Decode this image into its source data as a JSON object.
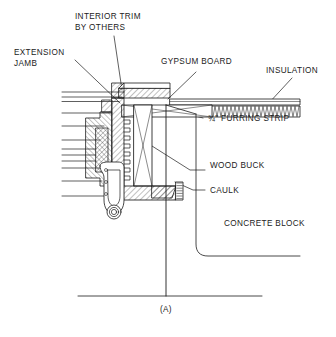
{
  "figure": {
    "id": "window-jamb-detail-a",
    "caption": "(A)",
    "type": "architectural-section-detail"
  },
  "labels": {
    "interior_trim": "INTERIOR TRIM\nBY OTHERS",
    "extension_jamb": "EXTENSION\nJAMB",
    "gypsum_board": "GYPSUM BOARD",
    "insulation": "INSULATION",
    "furring_strip": "¾\" FURRING STRIP",
    "wood_buck": "WOOD BUCK",
    "caulk": "CAULK",
    "concrete_block": "CONCRETE BLOCK"
  },
  "colors": {
    "line": "#1b1b1b",
    "background": "#ffffff",
    "hatch": "#3a3a3a"
  }
}
